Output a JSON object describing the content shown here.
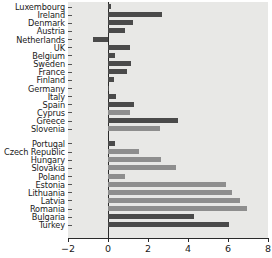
{
  "chart_data": {
    "type": "bar",
    "orientation": "horizontal",
    "title": "",
    "subtitle": "",
    "xlabel": "",
    "ylabel": "",
    "xlim": [
      -2,
      8
    ],
    "xticks": [
      -2,
      0,
      2,
      4,
      6,
      8
    ],
    "xticklabels": [
      "−2",
      "0",
      "2",
      "4",
      "6",
      "8"
    ],
    "grid": false,
    "legend": "none",
    "zero_reference_line": true,
    "group_gap_after_index": 16,
    "colors": {
      "dark_bar": "#4a4a4a",
      "light_bar": "#8e8e8e",
      "plot_background": "#e8e8e6",
      "axis": "#2a2a2a",
      "text": "#1a1a1a"
    },
    "categories": [
      "Luxembourg",
      "Ireland",
      "Denmark",
      "Austria",
      "Netherlands",
      "UK",
      "Belgium",
      "Sweden",
      "France",
      "Finland",
      "Germany",
      "Italy",
      "Spain",
      "Cyprus",
      "Greece",
      "Slovenia",
      "Portugal",
      "Czech Republic",
      "Hungary",
      "Slovakia",
      "Poland",
      "Estonia",
      "Lithuania",
      "Latvia",
      "Romania",
      "Bulgaria",
      "Turkey"
    ],
    "values": [
      0.15,
      2.7,
      1.25,
      0.85,
      -0.75,
      1.1,
      0.35,
      1.15,
      0.95,
      0.3,
      0.05,
      0.4,
      1.3,
      1.1,
      3.5,
      2.6,
      0.35,
      1.55,
      2.65,
      3.4,
      0.85,
      5.9,
      6.2,
      6.6,
      6.95,
      4.3,
      6.05
    ],
    "bar_shades": [
      "dark",
      "dark",
      "dark",
      "dark",
      "dark",
      "dark",
      "dark",
      "dark",
      "dark",
      "dark",
      "dark",
      "dark",
      "dark",
      "light",
      "dark",
      "light",
      "dark",
      "light",
      "light",
      "light",
      "light",
      "light",
      "light",
      "light",
      "light",
      "dark",
      "dark"
    ]
  }
}
